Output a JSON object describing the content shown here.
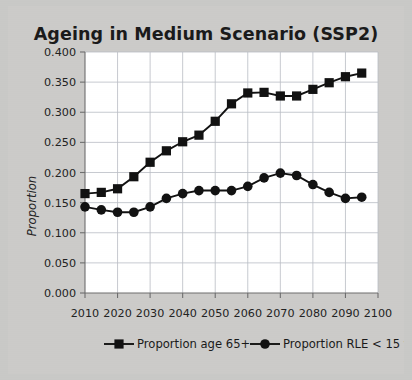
{
  "chart_data": {
    "type": "line",
    "title": "Ageing in Medium Scenario (SSP2)",
    "xlabel": "",
    "ylabel": "Proportion",
    "xlim": [
      2010,
      2100
    ],
    "ylim": [
      0.0,
      0.4
    ],
    "grid": true,
    "legend_position": "bottom",
    "x": [
      2010,
      2015,
      2020,
      2025,
      2030,
      2035,
      2040,
      2045,
      2050,
      2055,
      2060,
      2065,
      2070,
      2075,
      2080,
      2085,
      2090,
      2095
    ],
    "xticks": [
      "2010",
      "2020",
      "2030",
      "2040",
      "2050",
      "2060",
      "2070",
      "2080",
      "2090",
      "2100"
    ],
    "yticks": [
      "0.000",
      "0.050",
      "0.100",
      "0.150",
      "0.200",
      "0.250",
      "0.300",
      "0.350",
      "0.400"
    ],
    "series": [
      {
        "name": "Proportion age 65+",
        "marker": "square",
        "color": "#111111",
        "values": [
          0.165,
          0.167,
          0.173,
          0.193,
          0.217,
          0.236,
          0.251,
          0.262,
          0.285,
          0.314,
          0.332,
          0.333,
          0.327,
          0.327,
          0.338,
          0.349,
          0.359,
          0.365
        ]
      },
      {
        "name": "Proportion RLE < 15 years",
        "marker": "circle",
        "color": "#111111",
        "values": [
          0.143,
          0.138,
          0.134,
          0.134,
          0.143,
          0.157,
          0.165,
          0.17,
          0.17,
          0.17,
          0.177,
          0.191,
          0.199,
          0.195,
          0.18,
          0.167,
          0.157,
          0.159
        ]
      }
    ]
  },
  "legend": {
    "items": [
      {
        "label": "Proportion age 65+",
        "marker": "square"
      },
      {
        "label": "Proportion RLE < 15 years",
        "marker": "circle"
      }
    ]
  }
}
